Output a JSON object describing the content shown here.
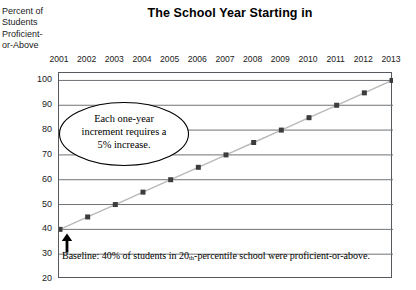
{
  "chart_data": {
    "type": "line",
    "title": "The School Year Starting in",
    "xlabel": "",
    "ylabel": "Percent of Students Proficient-or-Above",
    "ylabel_lines": [
      "Percent of",
      "Students",
      "Proficient-",
      "or-Above"
    ],
    "categories": [
      "2001",
      "2002",
      "2003",
      "2004",
      "2005",
      "2006",
      "2007",
      "2008",
      "2009",
      "2010",
      "2011",
      "2012",
      "2013"
    ],
    "values": [
      40,
      45,
      50,
      55,
      60,
      65,
      70,
      75,
      80,
      85,
      90,
      95,
      100
    ],
    "ylim": [
      20,
      103
    ],
    "yticks": [
      100,
      90,
      80,
      70,
      60,
      50,
      40,
      30,
      20
    ],
    "grid": true,
    "legend": "none",
    "marker": "square",
    "marker_color": "#3c3c3c",
    "line_color": "#b9b9b9",
    "axis_color": "#55585c",
    "gridline_color": "#6f7276",
    "annotations": [
      {
        "name": "increment-callout",
        "shape": "ellipse",
        "lines": [
          "Each one-year",
          "increment requires a",
          "5% increase."
        ],
        "text": "Each one-year increment requires a 5% increase."
      },
      {
        "name": "baseline-note",
        "text_before_sup": "Baseline: 40% of students in 20",
        "sup": "th",
        "text_after_sup": "-percentile school were proficient-or-above.",
        "text": "Baseline: 40% of students in 20th-percentile school were proficient-or-above."
      },
      {
        "name": "baseline-arrow",
        "shape": "up-arrow",
        "points_at_year": "2001",
        "points_at_value": 40
      }
    ]
  }
}
